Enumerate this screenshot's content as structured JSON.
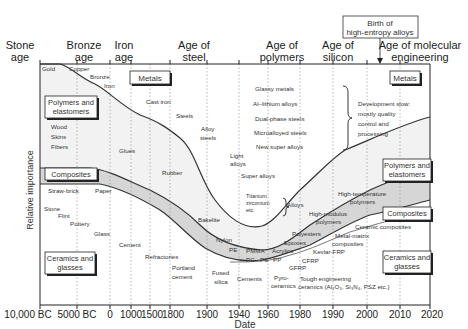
{
  "diagram": {
    "xlabel": "Date",
    "ylabel": "Relative importance",
    "ages": [
      {
        "id": "stone",
        "line1": "Stone",
        "line2": "age"
      },
      {
        "id": "bronze",
        "line1": "Bronze",
        "line2": "age"
      },
      {
        "id": "iron",
        "line1": "Iron",
        "line2": "age"
      },
      {
        "id": "steel",
        "line1": "Age of",
        "line2": "steel"
      },
      {
        "id": "polymers",
        "line1": "Age of",
        "line2": "polymers"
      },
      {
        "id": "silicon",
        "line1": "Age of",
        "line2": "silicon"
      },
      {
        "id": "molecular",
        "line1": "Age of molecular",
        "line2": "engineering"
      }
    ],
    "callout": {
      "line1": "Birth of",
      "line2": "high-entropy alloys"
    },
    "x_ticks": [
      "10,000 BC",
      "5000 BC",
      "0",
      "1000",
      "1500",
      "1800",
      "1900",
      "1940",
      "1960",
      "1980",
      "1990",
      "2000",
      "2010",
      "2020"
    ],
    "class_boxes": {
      "metals_left": "Metals",
      "metals_right": "Metals",
      "polymers_left_1": "Polymers and",
      "polymers_left_2": "elastomers",
      "polymers_right_1": "Polymers and",
      "polymers_right_2": "elastomers",
      "composites_left": "Composites",
      "composites_right": "Composites",
      "ceramics_left_1": "Ceramics and",
      "ceramics_left_2": "glasses",
      "ceramics_right_1": "Ceramics and",
      "ceramics_right_2": "glasses"
    },
    "materials": {
      "gold": "Gold",
      "copper": "Copper",
      "bronze": "Bronze",
      "iron": "Iron",
      "cast_iron": "Cast iron",
      "steels": "Steels",
      "alloy_steels_1": "Alloy",
      "alloy_steels_2": "steels",
      "light_alloys_1": "Light",
      "light_alloys_2": "alloys",
      "super_alloys": "Super alloys",
      "titanium": "Titanium",
      "zirconium": "zirconium",
      "etc": "etc.",
      "alloys": "Alloys",
      "glassy_metals": "Glassy metals",
      "al_lithium": "Al–lithium alloys",
      "dual_phase": "Dual-phase steels",
      "microalloyed": "Microalloyed steels",
      "new_super": "New super alloys",
      "dev_1": "Development slow:",
      "dev_2": "mostly quality",
      "dev_3": "control and",
      "dev_4": "processing",
      "wood": "Wood",
      "skins": "Skins",
      "fibers": "Fibers",
      "glues": "Glues",
      "rubber": "Rubber",
      "bakelite": "Bakelite",
      "nylon": "Nylon",
      "pe": "PE",
      "pmma": "PMMA",
      "acrylics": "Acrylics",
      "pc": "PC",
      "ps": "PS",
      "pp": "PP",
      "polyesters": "Polyesters",
      "epoxies": "Epoxies",
      "hm_poly_1": "High-modulus",
      "hm_poly_2": "polymers",
      "ht_poly_1": "High-temperature",
      "ht_poly_2": "polymers",
      "straw_brick": "Straw-brick",
      "paper": "Paper",
      "gfrp": "GFRP",
      "cfrp": "CFRP",
      "kevlar": "Kevlar-FRP",
      "mmc_1": "Metal-matrix",
      "mmc_2": "composites",
      "ceramic_composites": "Ceramic composites",
      "stone": "Stone",
      "flint": "Flint",
      "pottery": "Pottery",
      "glass": "Glass",
      "cement": "Cement",
      "refractories": "Refractories",
      "portland_1": "Portland",
      "portland_2": "cement",
      "fused_1": "Fused",
      "fused_2": "silica",
      "cements": "Cements",
      "pyro_1": "Pyro-",
      "pyro_2": "ceramics",
      "tough_1": "Tough engineering",
      "tough_2": "ceramics (Al₂O₃, Si₃N₄, PSZ etc.)"
    },
    "colors": {
      "axis": "#222222",
      "fill_light": "#f0f0f0",
      "fill_band": "#d6d6d6",
      "fill_composites": "#dcdcdc",
      "line": "#333333",
      "grid": "#888888"
    }
  }
}
